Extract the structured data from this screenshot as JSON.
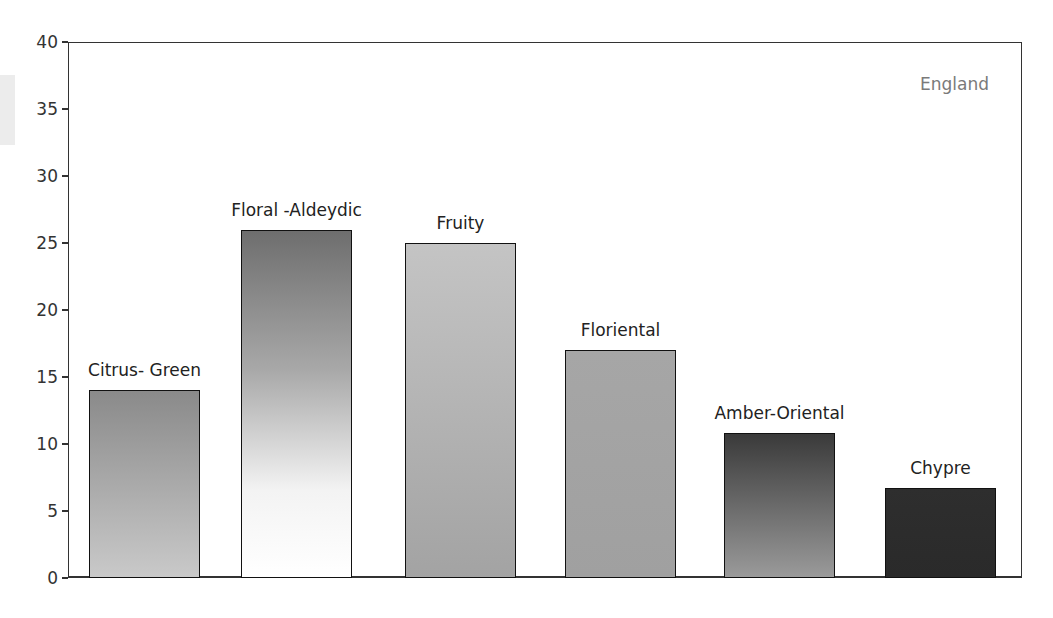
{
  "chart_data": {
    "type": "bar",
    "title": "",
    "annotation": "England",
    "xlabel": "",
    "ylabel": "",
    "ylim": [
      0,
      40
    ],
    "yticks": [
      0,
      5,
      10,
      15,
      20,
      25,
      30,
      35,
      40
    ],
    "grid": false,
    "legend": "none",
    "categories": [
      "Citrus- Green",
      "Floral -Aldeydic",
      "Fruity",
      "Floriental",
      "Amber-Oriental",
      "Chypre"
    ],
    "values": [
      14,
      26,
      25,
      17,
      10.8,
      6.7
    ],
    "bar_fills": [
      "linear-gradient(to bottom,#8a8a8a,#c9c9c9)",
      "linear-gradient(to bottom,#6e6e6e 0%,#a8a8a8 40%,#f3f3f3 75%,#ffffff 100%)",
      "linear-gradient(to bottom,#c4c4c4,#a3a3a3)",
      "linear-gradient(to bottom,#a6a6a6,#a0a0a0)",
      "linear-gradient(to bottom,#3a3a3a,#9a9a9a)",
      "linear-gradient(to bottom,#2e2e2e,#2a2a2a)"
    ]
  }
}
